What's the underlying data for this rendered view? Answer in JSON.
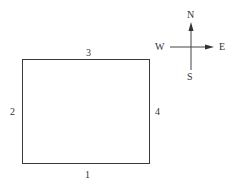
{
  "diagram": {
    "type": "rectangle with numbered sides and compass",
    "sides": {
      "bottom": "1",
      "left": "2",
      "top": "3",
      "right": "4"
    },
    "compass": {
      "north": "N",
      "south": "S",
      "west": "W",
      "east": "E"
    }
  }
}
